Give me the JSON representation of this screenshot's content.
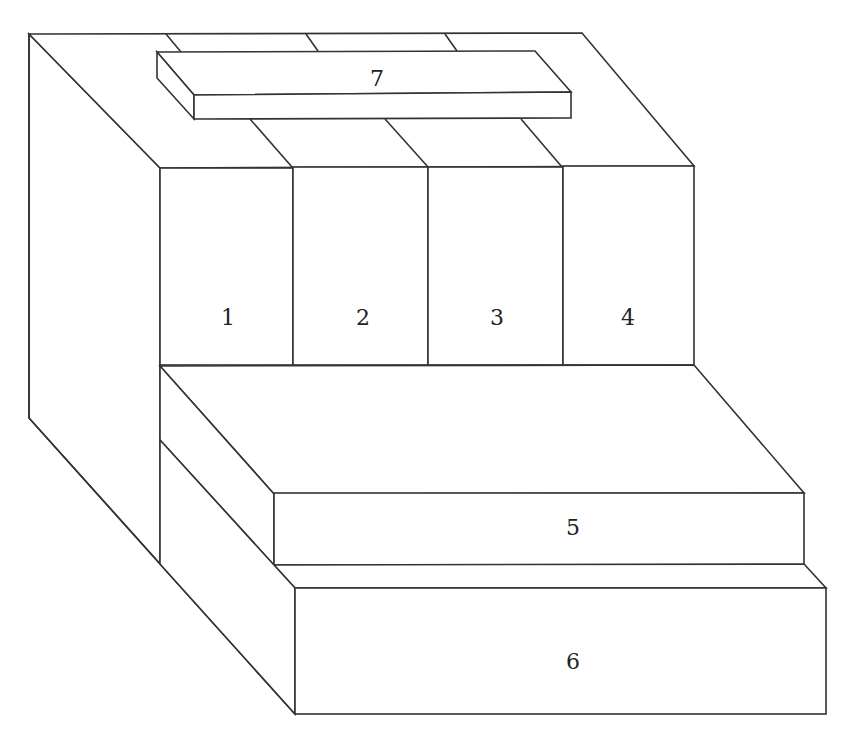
{
  "diagram": {
    "type": "isometric-block-stack",
    "line_color": "#333333",
    "background": "#ffffff",
    "blocks": [
      {
        "id": "1",
        "label": "1"
      },
      {
        "id": "2",
        "label": "2"
      },
      {
        "id": "3",
        "label": "3"
      },
      {
        "id": "4",
        "label": "4"
      },
      {
        "id": "5",
        "label": "5"
      },
      {
        "id": "6",
        "label": "6"
      },
      {
        "id": "7",
        "label": "7"
      }
    ]
  }
}
